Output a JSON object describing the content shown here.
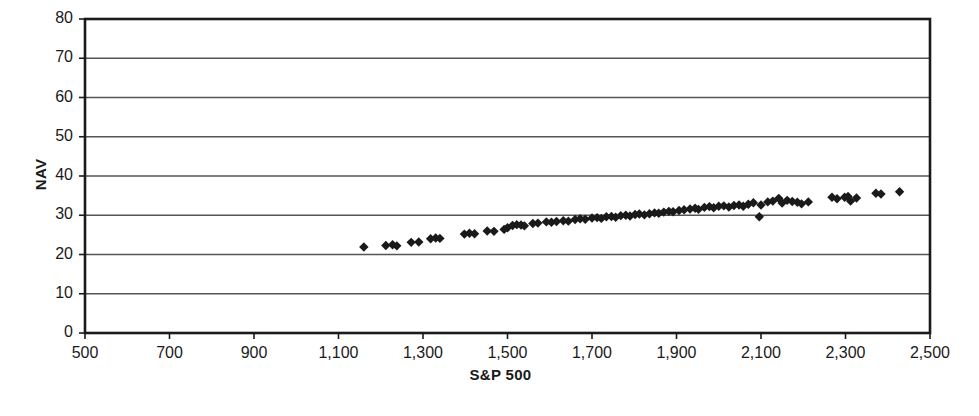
{
  "chart_data": {
    "type": "scatter",
    "title": "",
    "xlabel": "S&P 500",
    "ylabel": "NAV",
    "xlim": [
      500,
      2500
    ],
    "ylim": [
      0,
      80
    ],
    "xtick_step": 200,
    "ytick_step": 10,
    "xticks": [
      "500",
      "700",
      "900",
      "1,100",
      "1,300",
      "1,500",
      "1,700",
      "1,900",
      "2,100",
      "2,300",
      "2,500"
    ],
    "yticks": [
      "0",
      "10",
      "20",
      "30",
      "40",
      "50",
      "60",
      "70",
      "80"
    ],
    "grid": "horizontal",
    "legend": "none",
    "marker": "diamond",
    "marker_color": "#1a1a1a",
    "marker_size": 7,
    "series": [
      {
        "name": "NAV vs S&P 500",
        "points": [
          [
            1160,
            21.9
          ],
          [
            1212,
            22.3
          ],
          [
            1228,
            22.5
          ],
          [
            1238,
            22.2
          ],
          [
            1272,
            23.1
          ],
          [
            1290,
            23.2
          ],
          [
            1318,
            24.0
          ],
          [
            1330,
            24.2
          ],
          [
            1340,
            24.1
          ],
          [
            1398,
            25.2
          ],
          [
            1410,
            25.4
          ],
          [
            1422,
            25.3
          ],
          [
            1452,
            26.0
          ],
          [
            1468,
            25.9
          ],
          [
            1492,
            26.4
          ],
          [
            1500,
            26.8
          ],
          [
            1512,
            27.4
          ],
          [
            1522,
            27.6
          ],
          [
            1532,
            27.5
          ],
          [
            1540,
            27.3
          ],
          [
            1560,
            27.9
          ],
          [
            1572,
            28.0
          ],
          [
            1592,
            28.3
          ],
          [
            1604,
            28.2
          ],
          [
            1616,
            28.4
          ],
          [
            1632,
            28.6
          ],
          [
            1644,
            28.5
          ],
          [
            1660,
            28.9
          ],
          [
            1672,
            29.1
          ],
          [
            1684,
            29.0
          ],
          [
            1700,
            29.3
          ],
          [
            1712,
            29.4
          ],
          [
            1722,
            29.2
          ],
          [
            1734,
            29.6
          ],
          [
            1746,
            29.7
          ],
          [
            1756,
            29.5
          ],
          [
            1768,
            29.9
          ],
          [
            1780,
            30.0
          ],
          [
            1790,
            29.8
          ],
          [
            1802,
            30.2
          ],
          [
            1812,
            30.3
          ],
          [
            1824,
            30.1
          ],
          [
            1836,
            30.4
          ],
          [
            1848,
            30.6
          ],
          [
            1858,
            30.5
          ],
          [
            1870,
            30.8
          ],
          [
            1882,
            31.0
          ],
          [
            1892,
            30.9
          ],
          [
            1906,
            31.2
          ],
          [
            1918,
            31.4
          ],
          [
            1932,
            31.6
          ],
          [
            1944,
            31.8
          ],
          [
            1952,
            31.5
          ],
          [
            1966,
            32.0
          ],
          [
            1978,
            32.2
          ],
          [
            1988,
            31.9
          ],
          [
            2000,
            32.3
          ],
          [
            2012,
            32.4
          ],
          [
            2024,
            32.1
          ],
          [
            2036,
            32.5
          ],
          [
            2048,
            32.6
          ],
          [
            2058,
            32.3
          ],
          [
            2070,
            32.8
          ],
          [
            2082,
            33.2
          ],
          [
            2096,
            29.6
          ],
          [
            2100,
            32.6
          ],
          [
            2116,
            33.4
          ],
          [
            2128,
            33.6
          ],
          [
            2142,
            34.3
          ],
          [
            2150,
            33.1
          ],
          [
            2162,
            33.8
          ],
          [
            2174,
            33.5
          ],
          [
            2186,
            33.3
          ],
          [
            2196,
            32.9
          ],
          [
            2212,
            33.4
          ],
          [
            2268,
            34.6
          ],
          [
            2280,
            34.2
          ],
          [
            2298,
            34.6
          ],
          [
            2306,
            34.8
          ],
          [
            2312,
            33.6
          ],
          [
            2326,
            34.4
          ],
          [
            2372,
            35.6
          ],
          [
            2384,
            35.4
          ],
          [
            2428,
            36.0
          ]
        ]
      }
    ]
  }
}
